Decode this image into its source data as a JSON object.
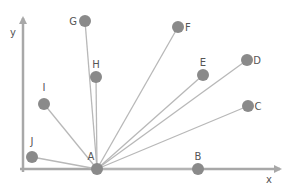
{
  "diagram": {
    "type": "vector-fan",
    "colors": {
      "axis": "#a8a8a8",
      "line": "#b8b8b8",
      "point": "#8a8a8a",
      "label": "#555555"
    },
    "axes": {
      "x": {
        "label": "x",
        "x1": 20,
        "y": 169,
        "x2": 280
      },
      "y": {
        "label": "y",
        "x": 23,
        "y1": 172,
        "y2": 18
      }
    },
    "origin": {
      "name": "A",
      "x": 97,
      "y": 169,
      "label_dx": -6,
      "label_dy": -9
    },
    "points": [
      {
        "name": "B",
        "x": 198,
        "y": 169,
        "label_dx": 0,
        "label_dy": -9
      },
      {
        "name": "C",
        "x": 248,
        "y": 106,
        "label_dx": 10,
        "label_dy": 4
      },
      {
        "name": "D",
        "x": 247,
        "y": 60,
        "label_dx": 10,
        "label_dy": 4
      },
      {
        "name": "E",
        "x": 203,
        "y": 75,
        "label_dx": 0,
        "label_dy": -9
      },
      {
        "name": "F",
        "x": 178,
        "y": 27,
        "label_dx": 10,
        "label_dy": 4
      },
      {
        "name": "G",
        "x": 85,
        "y": 21,
        "label_dx": -12,
        "label_dy": 4
      },
      {
        "name": "H",
        "x": 96,
        "y": 77,
        "label_dx": 0,
        "label_dy": -9
      },
      {
        "name": "I",
        "x": 44,
        "y": 104,
        "label_dx": 0,
        "label_dy": -13
      },
      {
        "name": "J",
        "x": 32,
        "y": 157,
        "label_dx": 0,
        "label_dy": -12
      }
    ]
  }
}
